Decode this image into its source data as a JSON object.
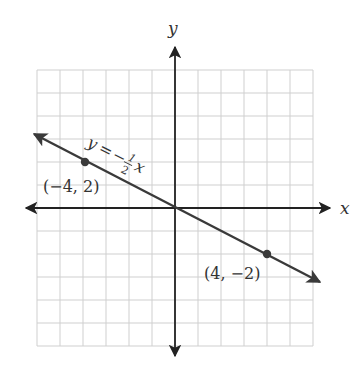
{
  "chart_data": {
    "type": "line",
    "title": "",
    "xlabel": "x",
    "ylabel": "y",
    "xlim": [
      -6,
      6
    ],
    "ylim": [
      -6,
      6
    ],
    "grid": true,
    "series": [
      {
        "name": "y = -1/2 x",
        "equation": "y = -½ x",
        "slope": -0.5,
        "intercept": 0,
        "x": [
          -6,
          6.5
        ],
        "y": [
          3,
          -3.25
        ]
      }
    ],
    "points": [
      {
        "x": -4,
        "y": 2,
        "label": "(−4, 2)"
      },
      {
        "x": 4,
        "y": -2,
        "label": "(4, −2)"
      }
    ],
    "annotations": [
      {
        "text": "y = −½ x",
        "position": "along line, upper left"
      }
    ]
  },
  "labels": {
    "x_axis": "x",
    "y_axis": "y",
    "equation_y": "y",
    "equation_eq": "=",
    "equation_minus": "−",
    "equation_num": "1",
    "equation_den": "2",
    "equation_x": "x",
    "point_a": "(−4, 2)",
    "point_b": "(4, −2)"
  },
  "colors": {
    "grid": "#cfcfcf",
    "axis": "#222222",
    "line": "#3a3a3a",
    "point": "#3a3a3a"
  }
}
